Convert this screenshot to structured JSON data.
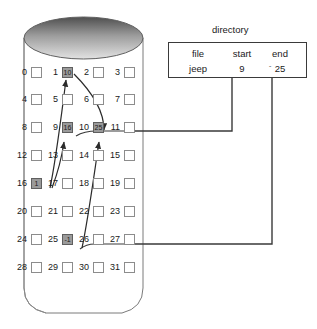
{
  "diagram": {
    "title_hidden": "linked allocation file system disk layout",
    "colors": {
      "ink": "#1a1a1a",
      "cell_border": "#8c8c8c",
      "cell_fill_empty": "#ffffff",
      "cell_fill_used": "#9a9a9a",
      "cylinder_stroke": "#6f6f6f",
      "cylinder_top_dark": "#5a5a5a",
      "cylinder_top_light": "#d8d8d8",
      "connector": "#3a3a3a",
      "pointer_arrow": "#2b2b2b"
    }
  },
  "disk": {
    "name": "disk-cylinder",
    "columns": 4,
    "rows": 8,
    "blocks": [
      {
        "index": "0",
        "value": "",
        "used": false
      },
      {
        "index": "1",
        "value": "10",
        "used": true
      },
      {
        "index": "2",
        "value": "",
        "used": false
      },
      {
        "index": "3",
        "value": "",
        "used": false
      },
      {
        "index": "4",
        "value": "",
        "used": false
      },
      {
        "index": "5",
        "value": "",
        "used": false
      },
      {
        "index": "6",
        "value": "",
        "used": false
      },
      {
        "index": "7",
        "value": "",
        "used": false
      },
      {
        "index": "8",
        "value": "",
        "used": false
      },
      {
        "index": "9",
        "value": "16",
        "used": true
      },
      {
        "index": "10",
        "value": "25",
        "used": true
      },
      {
        "index": "11",
        "value": "",
        "used": false
      },
      {
        "index": "12",
        "value": "",
        "used": false
      },
      {
        "index": "13",
        "value": "",
        "used": false
      },
      {
        "index": "14",
        "value": "",
        "used": false
      },
      {
        "index": "15",
        "value": "",
        "used": false
      },
      {
        "index": "16",
        "value": "1",
        "used": true
      },
      {
        "index": "17",
        "value": "",
        "used": false
      },
      {
        "index": "18",
        "value": "",
        "used": false
      },
      {
        "index": "19",
        "value": "",
        "used": false
      },
      {
        "index": "20",
        "value": "",
        "used": false
      },
      {
        "index": "21",
        "value": "",
        "used": false
      },
      {
        "index": "22",
        "value": "",
        "used": false
      },
      {
        "index": "23",
        "value": "",
        "used": false
      },
      {
        "index": "24",
        "value": "",
        "used": false
      },
      {
        "index": "25",
        "value": "-1",
        "used": true
      },
      {
        "index": "26",
        "value": "",
        "used": false
      },
      {
        "index": "27",
        "value": "",
        "used": false
      },
      {
        "index": "28",
        "value": "",
        "used": false
      },
      {
        "index": "29",
        "value": "",
        "used": false
      },
      {
        "index": "30",
        "value": "",
        "used": false
      },
      {
        "index": "31",
        "value": "",
        "used": false
      }
    ]
  },
  "directory": {
    "title": "directory",
    "headers": {
      "file": "file",
      "start": "start",
      "end": "end"
    },
    "rows": [
      {
        "file": "jeep",
        "start": "9",
        "tick": "ˇ",
        "end": "25"
      }
    ]
  },
  "pointers": [
    {
      "from": "16",
      "to": "9",
      "label": "block-16-to-block-9"
    },
    {
      "from": "16",
      "to": "1",
      "label": "block-16-to-block-1"
    },
    {
      "from": "25",
      "to": "10",
      "label": "block-25-to-block-10"
    },
    {
      "from": "1",
      "to": "10",
      "label": "block-1-to-block-10"
    }
  ],
  "connectors": [
    {
      "name": "start-connector",
      "from": "directory.start",
      "to": "block-9"
    },
    {
      "name": "end-connector",
      "from": "directory.end",
      "to": "block-25"
    }
  ]
}
